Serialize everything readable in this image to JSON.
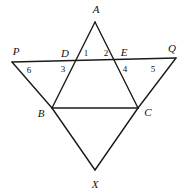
{
  "figure": {
    "kind": "geometry-diagram",
    "width": 188,
    "height": 194,
    "background_color": "#ffffff",
    "stroke_color": "#1a1a1a",
    "stroke_width": 1.4
  },
  "points": {
    "A": {
      "label": "A",
      "x": 95,
      "y": 22,
      "label_x": 96,
      "label_y": 9
    },
    "P": {
      "label": "P",
      "x": 12,
      "y": 62,
      "label_x": 16,
      "label_y": 51
    },
    "D": {
      "label": "D",
      "x": 75,
      "y": 60,
      "label_x": 65,
      "label_y": 53
    },
    "E": {
      "label": "E",
      "x": 115,
      "y": 60,
      "label_x": 124,
      "label_y": 52
    },
    "Q": {
      "label": "Q",
      "x": 176,
      "y": 58,
      "label_x": 172,
      "label_y": 48
    },
    "B": {
      "label": "B",
      "x": 52,
      "y": 108,
      "label_x": 41,
      "label_y": 113
    },
    "C": {
      "label": "C",
      "x": 138,
      "y": 108,
      "label_x": 148,
      "label_y": 112
    },
    "X": {
      "label": "X",
      "x": 95,
      "y": 170,
      "label_x": 95,
      "label_y": 184
    }
  },
  "angle_labels": [
    {
      "name": "angle-1",
      "text": "1",
      "x": 86,
      "y": 53
    },
    {
      "name": "angle-2",
      "text": "2",
      "x": 106,
      "y": 53
    },
    {
      "name": "angle-3",
      "text": "3",
      "x": 63,
      "y": 69
    },
    {
      "name": "angle-4",
      "text": "4",
      "x": 125,
      "y": 69
    },
    {
      "name": "angle-5",
      "text": "5",
      "x": 153,
      "y": 69
    },
    {
      "name": "angle-6",
      "text": "6",
      "x": 29,
      "y": 70
    }
  ],
  "segments": [
    {
      "name": "line-PQ",
      "from": "P",
      "to": "Q"
    },
    {
      "name": "line-A-to-B",
      "from": "A",
      "to": "B"
    },
    {
      "name": "line-A-to-C",
      "from": "A",
      "to": "C"
    },
    {
      "name": "line-B-to-C",
      "from": "B",
      "to": "C"
    },
    {
      "name": "line-B-to-X",
      "from": "B",
      "to": "X"
    },
    {
      "name": "line-C-to-X",
      "from": "C",
      "to": "X"
    },
    {
      "name": "line-P-to-B",
      "from": "P",
      "to": "B"
    },
    {
      "name": "line-Q-to-C",
      "from": "Q",
      "to": "C"
    }
  ]
}
